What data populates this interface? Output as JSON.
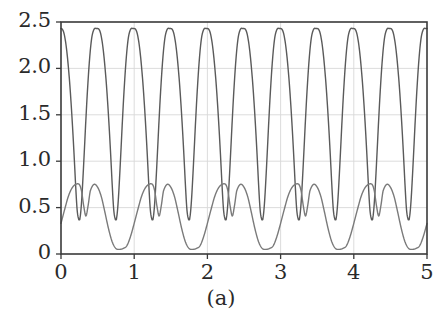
{
  "chart_data": {
    "type": "line",
    "title": "",
    "subtitle": "",
    "caption": "(a)",
    "xlabel": "",
    "ylabel": "",
    "xlim": [
      0,
      5
    ],
    "ylim": [
      0,
      2.5
    ],
    "grid": true,
    "grid_color": "#d8d8d8",
    "legend": null,
    "legend_position": "none",
    "axis_color": "#3a3a3a",
    "background": "#ffffff",
    "x_ticks": [
      0,
      1,
      2,
      3,
      4,
      5
    ],
    "x_tick_labels": [
      "0",
      "1",
      "2",
      "3",
      "4",
      "5"
    ],
    "y_ticks": [
      0,
      0.5,
      1.0,
      1.5,
      2.0,
      2.5
    ],
    "y_tick_labels": [
      "0",
      "0.5",
      "1.0",
      "1.5",
      "2.0",
      "2.5"
    ],
    "series": [
      {
        "name": "upper-oscillation",
        "color": "#5a5a5a",
        "line_width": 1.4,
        "period": 0.5,
        "min": 0.37,
        "max": 2.43,
        "description": "Fast oscillation, period 0.5, sharp V-shaped minima near 0.37 and rounded peaks near 2.43",
        "x": [
          0.0,
          0.02,
          0.04,
          0.06,
          0.08,
          0.1,
          0.12,
          0.14,
          0.16,
          0.18,
          0.2,
          0.22,
          0.24,
          0.25,
          0.26,
          0.28,
          0.3,
          0.32,
          0.34,
          0.36,
          0.38,
          0.4,
          0.42,
          0.44,
          0.46,
          0.48,
          0.5
        ],
        "y": [
          2.43,
          2.42,
          2.38,
          2.3,
          2.18,
          2.02,
          1.83,
          1.6,
          1.34,
          1.05,
          0.74,
          0.48,
          0.38,
          0.37,
          0.39,
          0.55,
          0.82,
          1.13,
          1.45,
          1.74,
          1.99,
          2.19,
          2.33,
          2.4,
          2.43,
          2.43,
          2.43
        ]
      },
      {
        "name": "lower-double-hump",
        "color": "#7a7a7a",
        "line_width": 1.4,
        "period": 1.0,
        "min": 0.05,
        "max": 0.76,
        "description": "Slow envelope, period 1.0; rises from 0.33 to first hump 0.75 near x=0.25, dips to 0.40 near x=0.33, second hump 0.75 near x=0.43, then deep valley to 0.05 spanning x=0.70-0.90",
        "x": [
          0.0,
          0.05,
          0.1,
          0.15,
          0.2,
          0.25,
          0.28,
          0.31,
          0.34,
          0.37,
          0.4,
          0.45,
          0.5,
          0.55,
          0.6,
          0.65,
          0.7,
          0.75,
          0.8,
          0.85,
          0.9,
          0.95,
          1.0
        ],
        "y": [
          0.33,
          0.48,
          0.62,
          0.71,
          0.75,
          0.75,
          0.68,
          0.52,
          0.41,
          0.52,
          0.68,
          0.75,
          0.72,
          0.62,
          0.45,
          0.27,
          0.13,
          0.06,
          0.05,
          0.06,
          0.09,
          0.19,
          0.33
        ]
      }
    ]
  },
  "caption": {
    "text": "(a)"
  }
}
